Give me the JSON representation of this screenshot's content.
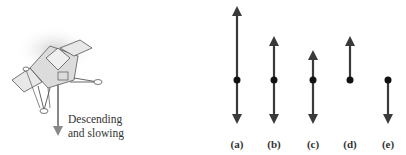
{
  "figure": {
    "lander": {
      "caption_line1": "Descending",
      "caption_line2": "and slowing"
    },
    "options": [
      {
        "label": "(a)",
        "x": 237,
        "up_len": 72,
        "down_len": 42
      },
      {
        "label": "(b)",
        "x": 274,
        "up_len": 40,
        "down_len": 42
      },
      {
        "label": "(c)",
        "x": 313,
        "up_len": 27,
        "down_len": 42
      },
      {
        "label": "(d)",
        "x": 350,
        "up_len": 40,
        "down_len": 0
      },
      {
        "label": "(e)",
        "x": 388,
        "up_len": 0,
        "down_len": 42
      }
    ],
    "arrow_color": "#3a3a3a",
    "dot_y": 80
  }
}
